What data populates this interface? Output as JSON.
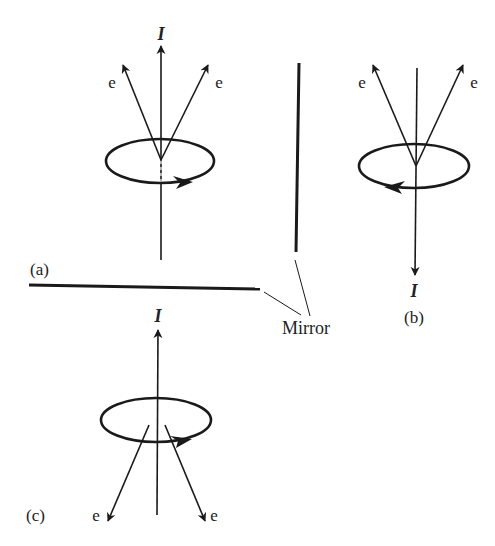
{
  "diagram": {
    "panels": {
      "a": {
        "label": "(a)",
        "current_label": "I",
        "electron_left": "e",
        "electron_right": "e"
      },
      "b": {
        "label": "(b)",
        "current_label": "I",
        "electron_left": "e",
        "electron_right": "e"
      },
      "c": {
        "label": "(c)",
        "current_label": "I",
        "electron_left": "e",
        "electron_right": "e"
      }
    },
    "mirror_label": "Mirror",
    "colors": {
      "ink": "#1a1a1a",
      "background": "#ffffff"
    }
  }
}
